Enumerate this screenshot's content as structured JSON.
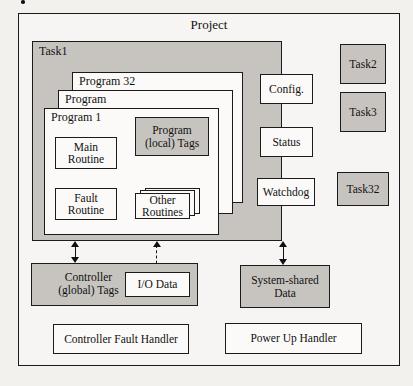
{
  "diagram": {
    "title": "Project",
    "type": "logix-project-structure",
    "colors": {
      "shaded_fill": "#c7c4c0",
      "white_fill": "#fbfaf8",
      "page_background": "#f3f1ee",
      "outline": "#1b1b1b"
    },
    "project": {
      "label": "Project",
      "task1": {
        "label": "Task1",
        "program_stack": [
          {
            "label": "Program 32"
          },
          {
            "label": "Program"
          },
          {
            "label": "Program 1"
          }
        ],
        "program_contents": {
          "main_routine": "Main\nRoutine",
          "fault_routine": "Fault\nRoutine",
          "program_local_tags": "Program\n(local) Tags",
          "other_routines": "Other\nRoutines"
        },
        "task_properties": [
          {
            "label": "Config."
          },
          {
            "label": "Status"
          },
          {
            "label": "Watchdog"
          }
        ]
      },
      "other_tasks": [
        {
          "label": "Task2"
        },
        {
          "label": "Task3"
        },
        {
          "label": "•••"
        },
        {
          "label": "Task32"
        }
      ],
      "data_blocks": {
        "controller_tags": "Controller\n(global) Tags",
        "io_data": "I/O Data",
        "system_shared_data": "System-shared\nData"
      },
      "handlers": [
        {
          "label": "Controller Fault Handler"
        },
        {
          "label": "Power Up Handler"
        }
      ]
    },
    "connectors": [
      {
        "name": "task1-to-controller-tags",
        "style": "solid",
        "heads": "both"
      },
      {
        "name": "task1-to-io-data",
        "style": "dashed",
        "heads": "both"
      },
      {
        "name": "task1-to-system-shared-data",
        "style": "solid",
        "heads": "both"
      }
    ]
  }
}
